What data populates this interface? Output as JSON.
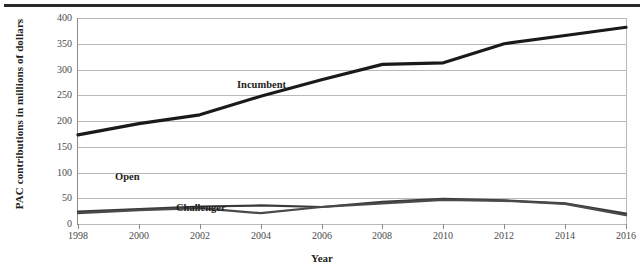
{
  "chart_data": {
    "type": "line",
    "title": "",
    "xlabel": "Year",
    "ylabel": "PAC contributions in millions of dollars",
    "categories": [
      1998,
      2000,
      2002,
      2004,
      2006,
      2008,
      2010,
      2012,
      2014,
      2016
    ],
    "x": [
      1998,
      2000,
      2002,
      2004,
      2006,
      2008,
      2010,
      2012,
      2014,
      2016
    ],
    "xlim": [
      1998,
      2016
    ],
    "ylim": [
      0,
      400
    ],
    "yticks": [
      0,
      50,
      100,
      150,
      200,
      250,
      300,
      350,
      400
    ],
    "xticks": [
      "1998",
      "2000",
      "2002",
      "2004",
      "2006",
      "2008",
      "2010",
      "2012",
      "2014",
      "2016"
    ],
    "grid": true,
    "legend_position": "inline-annotations",
    "series": [
      {
        "name": "Incumbent",
        "values": [
          173,
          195,
          212,
          248,
          280,
          310,
          313,
          350,
          366,
          382
        ],
        "color": "#1a1a1a",
        "label_x": 2004,
        "label_y": 268
      },
      {
        "name": "Open",
        "values": [
          24,
          29,
          34,
          36,
          33,
          43,
          49,
          46,
          40,
          20
        ],
        "color": "#3a3a3a",
        "label_x": 2000,
        "label_y": 90
      },
      {
        "name": "Challenger",
        "values": [
          21,
          27,
          31,
          21,
          33,
          40,
          47,
          45,
          39,
          17
        ],
        "color": "#4a4a4a",
        "label_x": 2002,
        "label_y": 30
      }
    ]
  },
  "figure": {
    "top_rule": true,
    "background": "#ffffff",
    "gridline_color": "#b9b9b9",
    "axis_color": "#8a8a8a",
    "text_color": "#231f20"
  }
}
